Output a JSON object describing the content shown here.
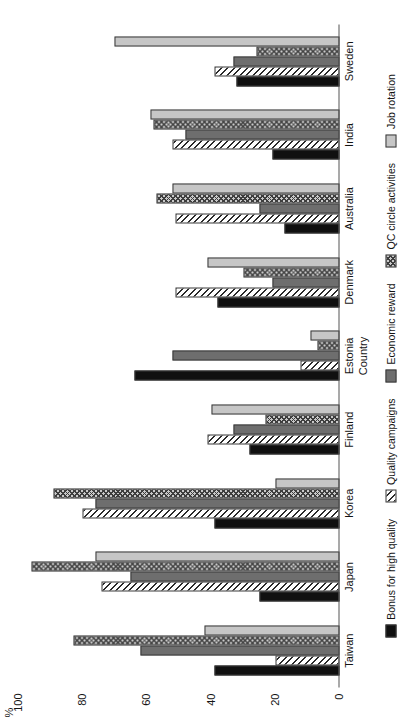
{
  "chart_data": {
    "type": "bar",
    "title": "",
    "xlabel": "Country",
    "ylabel": "%",
    "ylim": [
      0,
      100
    ],
    "yticks": [
      0,
      20,
      40,
      60,
      80,
      100
    ],
    "grid": false,
    "orientation": "horizontal-rotated",
    "legend_position": "bottom",
    "categories": [
      "Taiwan",
      "Japan",
      "Korea",
      "Finland",
      "Estonia",
      "Denmark",
      "Australia",
      "India",
      "Sweden"
    ],
    "series": [
      {
        "name": "Bonus for high quality",
        "pattern": "solid-black",
        "color": "#101010",
        "values": [
          39,
          25,
          39,
          28,
          64,
          38,
          17,
          21,
          32
        ]
      },
      {
        "name": "Quality campaigns",
        "pattern": "diagonal-hatch",
        "color": "#2b2b2b",
        "values": [
          20,
          74,
          80,
          41,
          12,
          51,
          51,
          52,
          39
        ]
      },
      {
        "name": "Economic reward",
        "pattern": "solid-gray",
        "color": "#6e6e6e",
        "values": [
          62,
          65,
          76,
          33,
          52,
          21,
          25,
          48,
          33
        ]
      },
      {
        "name": "QC circle activities",
        "pattern": "cross-hatch",
        "color": "#c9c9c9",
        "values": [
          83,
          96,
          89,
          23,
          7,
          30,
          57,
          58,
          26
        ]
      },
      {
        "name": "Job rotation",
        "pattern": "solid-light-gray",
        "color": "#c6c6c6",
        "values": [
          42,
          76,
          20,
          40,
          9,
          41,
          52,
          59,
          70
        ]
      }
    ]
  },
  "axes": {
    "value_unit": "%",
    "value_ticks": [
      "0",
      "20",
      "40",
      "60",
      "80",
      "100"
    ],
    "category_title": "Country"
  },
  "legend": {
    "items": [
      {
        "label": "Bonus for high quality",
        "swatch": "solid-black-swatch"
      },
      {
        "label": "Quality campaigns",
        "swatch": "diagonal-hatch-swatch"
      },
      {
        "label": "Economic reward",
        "swatch": "solid-gray-swatch"
      },
      {
        "label": "QC circle activities",
        "swatch": "cross-hatch-swatch"
      },
      {
        "label": "Job rotation",
        "swatch": "solid-light-gray-swatch"
      }
    ]
  }
}
